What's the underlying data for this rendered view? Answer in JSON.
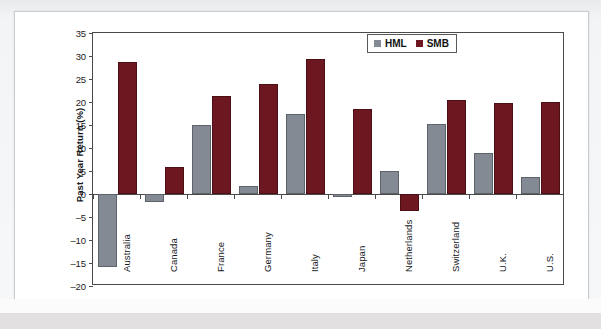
{
  "chart_data": {
    "type": "bar",
    "title": "",
    "xlabel": "",
    "ylabel": "Past Year Return (%)",
    "ylim": [
      -20,
      35
    ],
    "ytick_step": 5,
    "yticks": [
      "35",
      "30",
      "25",
      "20",
      "15",
      "10",
      "5",
      "0",
      "–5",
      "–10",
      "–15",
      "–20"
    ],
    "grid": false,
    "legend_position": "top-right",
    "categories": [
      "Australia",
      "Canada",
      "France",
      "Germany",
      "Italy",
      "Japan",
      "Netherlands",
      "Switzerland",
      "U.K.",
      "U.S."
    ],
    "series": [
      {
        "name": "HML",
        "color": "#848a93",
        "values": [
          -15.8,
          -1.8,
          15.0,
          1.8,
          17.3,
          -0.7,
          5.1,
          15.2,
          9.0,
          3.6
        ]
      },
      {
        "name": "SMB",
        "color": "#6d1720",
        "values": [
          28.6,
          5.8,
          21.2,
          23.9,
          29.4,
          18.5,
          -3.7,
          20.4,
          19.8,
          20.0
        ]
      }
    ]
  },
  "legend": {
    "items": [
      {
        "label": "HML",
        "color": "#848a93"
      },
      {
        "label": "SMB",
        "color": "#6d1720"
      }
    ]
  },
  "axis": {
    "y_title": "Past Year Return (%)"
  }
}
